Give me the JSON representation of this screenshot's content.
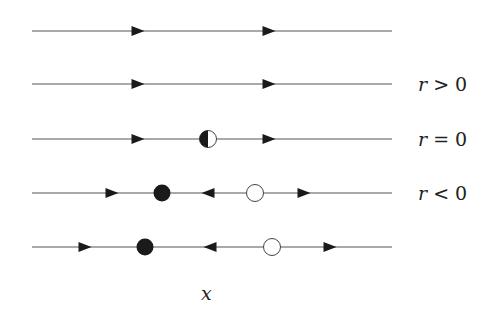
{
  "figure": {
    "type": "phase-portrait-bifurcation",
    "axis_label": "x",
    "line_color": "#555555",
    "marker_color": "#1a1a1a",
    "rows": [
      {
        "id": "row-1",
        "y": 31,
        "label": "",
        "arrows": [
          {
            "x": 138,
            "dir": "right"
          },
          {
            "x": 269,
            "dir": "right"
          }
        ],
        "points": []
      },
      {
        "id": "row-2",
        "y": 84,
        "label": "r > 0",
        "label_var": "r",
        "label_rel": "> 0",
        "arrows": [
          {
            "x": 138,
            "dir": "right"
          },
          {
            "x": 269,
            "dir": "right"
          }
        ],
        "points": []
      },
      {
        "id": "row-3",
        "y": 139,
        "label": "r = 0",
        "label_var": "r",
        "label_rel": "= 0",
        "arrows": [
          {
            "x": 138,
            "dir": "right"
          },
          {
            "x": 269,
            "dir": "right"
          }
        ],
        "points": [
          {
            "x": 208,
            "kind": "half-stable"
          }
        ]
      },
      {
        "id": "row-4",
        "y": 193,
        "label": "r < 0",
        "label_var": "r",
        "label_rel": "< 0",
        "arrows": [
          {
            "x": 112,
            "dir": "right"
          },
          {
            "x": 208,
            "dir": "left"
          },
          {
            "x": 304,
            "dir": "right"
          }
        ],
        "points": [
          {
            "x": 162,
            "kind": "stable"
          },
          {
            "x": 255,
            "kind": "unstable"
          }
        ]
      },
      {
        "id": "row-5",
        "y": 247,
        "label": "",
        "arrows": [
          {
            "x": 85,
            "dir": "right"
          },
          {
            "x": 210,
            "dir": "left"
          },
          {
            "x": 330,
            "dir": "right"
          }
        ],
        "points": [
          {
            "x": 145,
            "kind": "stable"
          },
          {
            "x": 272,
            "kind": "unstable"
          }
        ]
      }
    ],
    "line_x_start": 32,
    "line_x_end": 392
  }
}
